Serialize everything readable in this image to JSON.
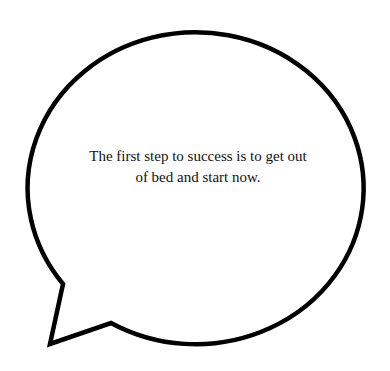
{
  "speech_bubble": {
    "text_lines": [
      "The first step to success is to get out",
      "of bed and start now."
    ],
    "stroke_color": "#000000",
    "fill_color": "#ffffff",
    "text_color": "#111111"
  }
}
